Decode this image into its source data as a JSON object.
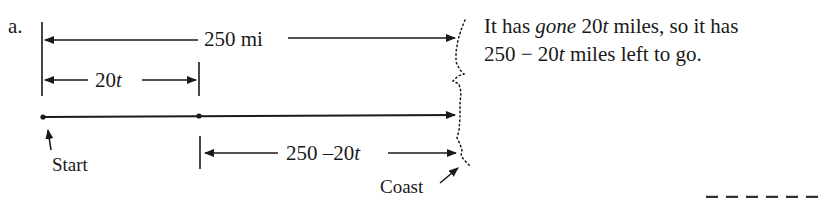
{
  "part_label": "a.",
  "labels": {
    "total_distance": "250 mi",
    "gone": "20",
    "gone_var": "t",
    "remaining": "250 –20",
    "remaining_var": "t",
    "start": "Start",
    "coast": "Coast"
  },
  "explanation": {
    "line1_a": "It has ",
    "line1_gone": "gone",
    "line1_b": " 20",
    "line1_t": "t",
    "line1_c": " miles, so it has",
    "line2_a": "250 − 20",
    "line2_t": "t",
    "line2_b": " miles left to go."
  },
  "colors": {
    "ink": "#1a1a1a",
    "background": "#ffffff"
  }
}
